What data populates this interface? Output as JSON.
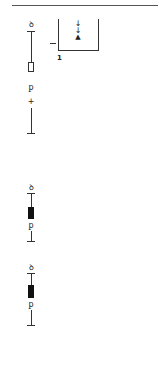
{
  "diagram": {
    "top_rule": true,
    "box": {
      "label": "1",
      "arrows": [
        "↓",
        "↓",
        "▲"
      ],
      "side_marker": "–"
    },
    "columns": [
      {
        "top_glyph": "ꝺ",
        "body_symbol": "outlined-block",
        "mid_glyph": "ꝑ",
        "small_glyph": "+"
      },
      {
        "top_glyph": "ꝺ",
        "body_symbol": "filled-block",
        "mid_glyph": "ꝑ"
      },
      {
        "top_glyph": "ꝺ",
        "body_symbol": "filled-block",
        "mid_glyph": "ꝑ"
      }
    ]
  }
}
